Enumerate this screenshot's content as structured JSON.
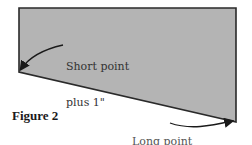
{
  "figure": {
    "caption": "Figure 2",
    "shape": {
      "fill": "#b4b4b4",
      "stroke": "#2a2a2a",
      "points": [
        [
          19,
          8
        ],
        [
          236,
          8
        ],
        [
          236,
          122
        ],
        [
          19,
          72
        ]
      ]
    },
    "annotations": [
      {
        "id": "short",
        "line1": "Short point",
        "line2": "plus 1\""
      },
      {
        "id": "long",
        "line1": "Long point",
        "line2": "plus 1\""
      }
    ]
  }
}
